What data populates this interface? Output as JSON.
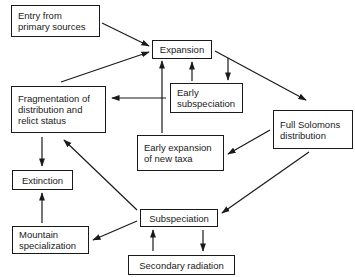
{
  "diagram": {
    "nodes": [
      {
        "id": "entry",
        "label": "Entry from\nprimary sources"
      },
      {
        "id": "expansion",
        "label": "Expansion"
      },
      {
        "id": "early_subspeciation",
        "label": "Early\nsubspeciation"
      },
      {
        "id": "fragmentation",
        "label": "Fragmentation of\ndistribution and\nrelict status"
      },
      {
        "id": "full_solomons",
        "label": "Full Solomons\ndistribution"
      },
      {
        "id": "early_expansion",
        "label": "Early expansion\nof new taxa"
      },
      {
        "id": "extinction",
        "label": "Extinction"
      },
      {
        "id": "subspeciation",
        "label": "Subspeciation"
      },
      {
        "id": "mountain",
        "label": "Mountain\nspecialization"
      },
      {
        "id": "secondary",
        "label": "Secondary radiation"
      }
    ],
    "edges": [
      {
        "from": "entry",
        "to": "expansion"
      },
      {
        "from": "fragmentation",
        "to": "expansion"
      },
      {
        "from": "early_subspeciation",
        "to": "expansion"
      },
      {
        "from": "expansion",
        "to": "early_subspeciation"
      },
      {
        "from": "expansion",
        "to": "full_solomons"
      },
      {
        "from": "early_expansion",
        "to": "expansion"
      },
      {
        "from": "early_expansion",
        "to": "fragmentation"
      },
      {
        "from": "full_solomons",
        "to": "early_expansion"
      },
      {
        "from": "full_solomons",
        "to": "subspeciation"
      },
      {
        "from": "fragmentation",
        "to": "extinction"
      },
      {
        "from": "subspeciation",
        "to": "fragmentation"
      },
      {
        "from": "subspeciation",
        "to": "mountain"
      },
      {
        "from": "mountain",
        "to": "extinction"
      },
      {
        "from": "secondary",
        "to": "subspeciation"
      },
      {
        "from": "subspeciation",
        "to": "secondary"
      }
    ]
  }
}
